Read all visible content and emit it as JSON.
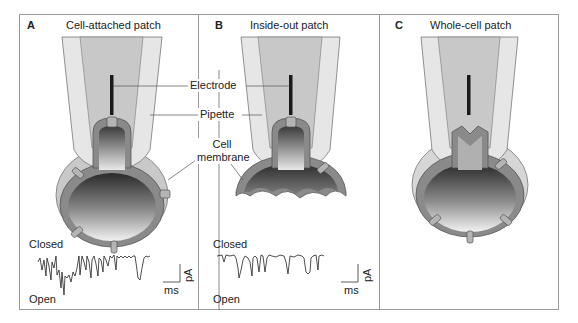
{
  "figure": {
    "panels": [
      {
        "letter": "A",
        "title": "Cell-attached patch",
        "trace": {
          "top_label": "Closed",
          "bottom_label": "Open",
          "x_unit": "ms",
          "y_unit": "pA"
        }
      },
      {
        "letter": "B",
        "title": "Inside-out patch",
        "trace": {
          "top_label": "Closed",
          "bottom_label": "Open",
          "x_unit": "ms",
          "y_unit": "pA"
        }
      },
      {
        "letter": "C",
        "title": "Whole-cell patch"
      }
    ],
    "callouts": {
      "electrode": "Electrode",
      "pipette": "Pipette",
      "membrane_line1": "Cell",
      "membrane_line2": "membrane"
    },
    "colors": {
      "pipette_outer": "#e6e6e6",
      "pipette_inner": "#c8c8c8",
      "membrane": "#8a8a8a",
      "channel": "#b4b4b4",
      "electrode": "#1a1a1a",
      "frame": "#9a9a9a"
    }
  }
}
